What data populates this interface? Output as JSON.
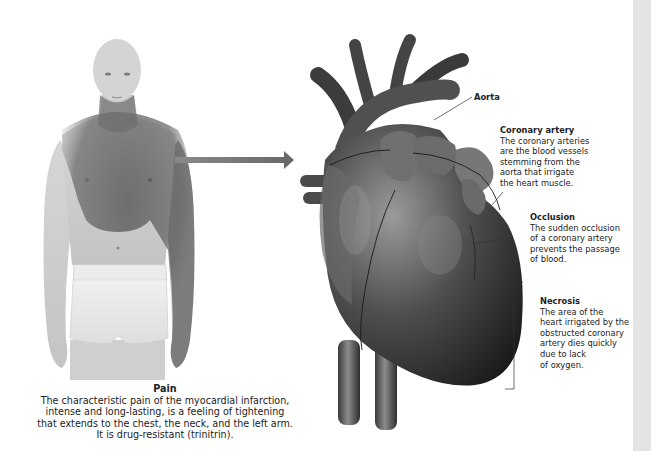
{
  "figure": {
    "pain": {
      "title": "Pain",
      "text": "The characteristic pain of the myocardial infarction,\nintense and long-lasting, is a feeling of tightening\nthat extends to the chest, the neck, and the left arm.\nIt is drug-resistant (trinitrin)."
    },
    "labels": {
      "aorta": {
        "title": "Aorta"
      },
      "coronary_artery": {
        "title": "Coronary artery",
        "text": "The coronary arteries\nare the blood vessels\nstemming from the\naorta that irrigate\nthe heart muscle."
      },
      "occlusion": {
        "title": "Occlusion",
        "text": "The sudden occlusion\nof a coronary artery\nprevents the passage\nof blood."
      },
      "necrosis": {
        "title": "Necrosis",
        "text": "The area of the\nheart irrigated by the\nobstructed coronary\nartery dies quickly\ndue to lack\nof oxygen."
      }
    },
    "colors": {
      "pain_zone": "#6e6e6e",
      "arrow": "#707070",
      "heart_dark": "#1e1e1e",
      "heart_mid": "#5a5a5a",
      "scroll_strip": "#e4e4e4"
    }
  }
}
